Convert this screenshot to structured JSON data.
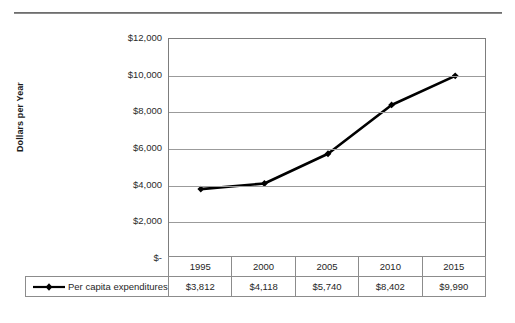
{
  "chart_data": {
    "type": "line",
    "title": "",
    "xlabel": "",
    "ylabel": "Dollars per Year",
    "categories": [
      "1995",
      "2000",
      "2005",
      "2010",
      "2015"
    ],
    "series": [
      {
        "name": "Per capita expenditures",
        "values": [
          3812,
          4118,
          5740,
          8402,
          9990
        ],
        "value_labels": [
          "$3,812",
          "$4,118",
          "$5,740",
          "$8,402",
          "$9,990"
        ],
        "color": "#000000",
        "marker": "diamond"
      }
    ],
    "ylim": [
      0,
      12000
    ],
    "ytick_values": [
      12000,
      10000,
      8000,
      6000,
      4000,
      2000,
      0
    ],
    "ytick_labels": [
      "$12,000",
      "$10,000",
      "$8,000",
      "$6,000",
      "$4,000",
      "$2,000",
      "$-"
    ],
    "grid": true,
    "legend_position": "bottom-left-table",
    "has_data_table": true
  },
  "axis": {
    "y_title": "Dollars per Year"
  },
  "legend": {
    "label": "Per capita expenditures"
  },
  "colors": {
    "line": "#000000",
    "grid": "#9b9b9b",
    "frame": "#7d7d7d",
    "text": "#1f1f1f",
    "rule": "#8a8a8a"
  }
}
